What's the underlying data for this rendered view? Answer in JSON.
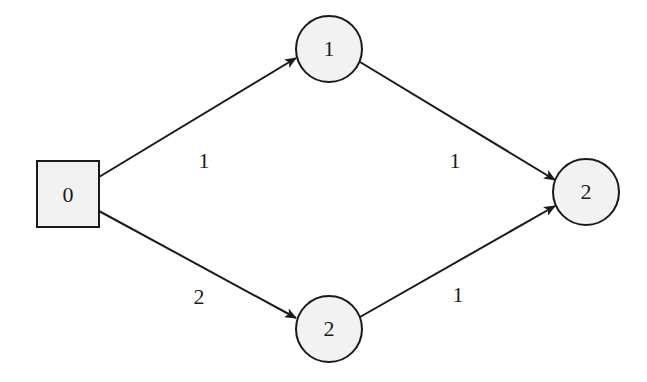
{
  "diagram": {
    "type": "directed-graph",
    "colors": {
      "node_fill": "#f2f2f2",
      "stroke": "#1a1a1a",
      "background": "#ffffff"
    },
    "nodes": [
      {
        "id": "n0",
        "label": "0",
        "shape": "square",
        "x": 37,
        "y": 161,
        "w": 62,
        "h": 66
      },
      {
        "id": "n1",
        "label": "1",
        "shape": "circle",
        "cx": 329,
        "cy": 49,
        "r": 33
      },
      {
        "id": "n2b",
        "label": "2",
        "shape": "circle",
        "cx": 329,
        "cy": 329,
        "r": 33
      },
      {
        "id": "n2r",
        "label": "2",
        "shape": "circle",
        "cx": 586,
        "cy": 192,
        "r": 33
      }
    ],
    "edges": [
      {
        "from": "n0",
        "to": "n1",
        "label": "1",
        "label_x": 204,
        "label_y": 168
      },
      {
        "from": "n0",
        "to": "n2b",
        "label": "2",
        "label_x": 199,
        "label_y": 304
      },
      {
        "from": "n1",
        "to": "n2r",
        "label": "1",
        "label_x": 455,
        "label_y": 168
      },
      {
        "from": "n2b",
        "to": "n2r",
        "label": "1",
        "label_x": 458,
        "label_y": 302
      }
    ]
  }
}
